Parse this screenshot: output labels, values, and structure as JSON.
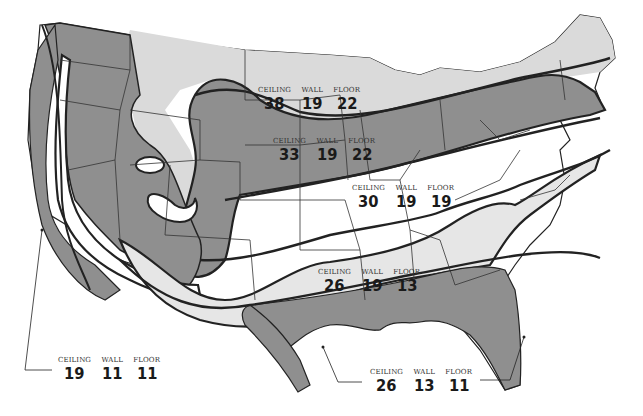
{
  "map": {
    "title": "",
    "subject": "Recommended insulation R-values by climate zone, continental United States",
    "colors": {
      "zone_dark": "#8f8f8f",
      "zone_light": "#dadada",
      "zone_white": "#ffffff",
      "border": "#222222",
      "state_line": "#333333"
    },
    "column_headers": {
      "ceiling": "CEILING",
      "wall": "WALL",
      "floor": "FLOOR"
    },
    "zones": [
      {
        "id": "north",
        "fill": "light",
        "ceiling": "38",
        "wall": "19",
        "floor": "22"
      },
      {
        "id": "north-central",
        "fill": "dark",
        "ceiling": "33",
        "wall": "19",
        "floor": "22"
      },
      {
        "id": "central",
        "fill": "white",
        "ceiling": "30",
        "wall": "19",
        "floor": "19"
      },
      {
        "id": "south-central",
        "fill": "light",
        "ceiling": "26",
        "wall": "19",
        "floor": "13"
      },
      {
        "id": "west-coast",
        "fill": "white",
        "ceiling": "19",
        "wall": "11",
        "floor": "11"
      },
      {
        "id": "gulf-coast",
        "fill": "dark",
        "ceiling": "26",
        "wall": "13",
        "floor": "11"
      }
    ]
  }
}
